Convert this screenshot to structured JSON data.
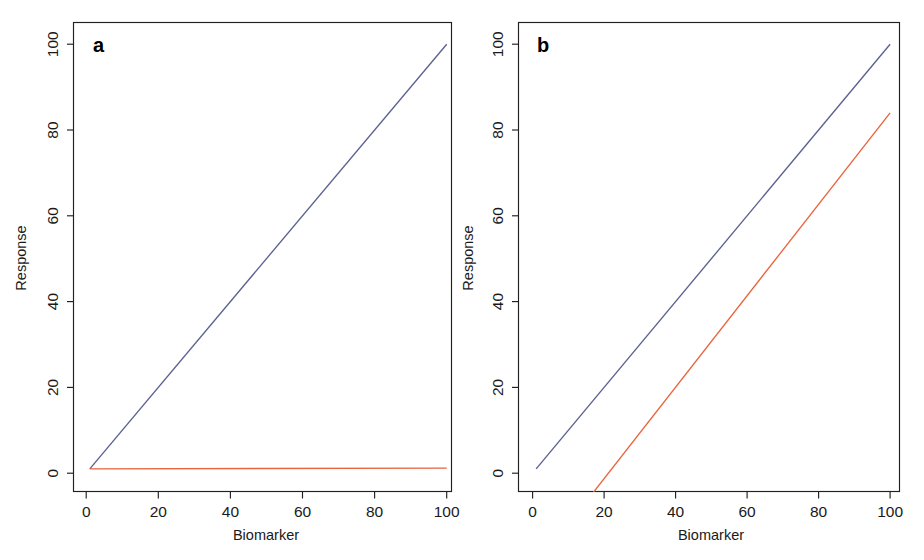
{
  "figure": {
    "width": 924,
    "height": 560,
    "background": "#ffffff"
  },
  "chart_data": [
    {
      "type": "line",
      "panel_label": "a",
      "title": "",
      "xlabel": "Biomarker",
      "ylabel": "Response",
      "xlim": [
        -1.5,
        104
      ],
      "ylim": [
        -7,
        105
      ],
      "xticks": [
        0,
        20,
        40,
        60,
        80,
        100
      ],
      "xtick_labels": [
        "0",
        "20",
        "40",
        "60",
        "80",
        "100"
      ],
      "yticks": [
        0,
        20,
        40,
        60,
        80,
        100
      ],
      "ytick_labels": [
        "0",
        "20",
        "40",
        "60",
        "80",
        "100"
      ],
      "grid": false,
      "legend": "none",
      "series": [
        {
          "name": "treatment-blue",
          "color": "#5b618f",
          "x": [
            1,
            100
          ],
          "values": [
            1,
            100
          ]
        },
        {
          "name": "control-orange",
          "color": "#e8643c",
          "x": [
            1,
            100
          ],
          "values": [
            1,
            1.2
          ]
        }
      ]
    },
    {
      "type": "line",
      "panel_label": "b",
      "title": "",
      "xlabel": "Biomarker",
      "ylabel": "Response",
      "xlim": [
        -1.5,
        104
      ],
      "ylim": [
        -7,
        105
      ],
      "xticks": [
        0,
        20,
        40,
        60,
        80,
        100
      ],
      "xtick_labels": [
        "0",
        "20",
        "40",
        "60",
        "80",
        "100"
      ],
      "yticks": [
        0,
        20,
        40,
        60,
        80,
        100
      ],
      "ytick_labels": [
        "0",
        "20",
        "40",
        "60",
        "80",
        "100"
      ],
      "grid": false,
      "legend": "none",
      "series": [
        {
          "name": "treatment-blue",
          "color": "#5b618f",
          "x": [
            1,
            100
          ],
          "values": [
            1,
            100
          ]
        },
        {
          "name": "control-orange",
          "color": "#e8643c",
          "x": [
            16.5,
            100
          ],
          "values": [
            -5,
            84
          ]
        }
      ]
    }
  ]
}
